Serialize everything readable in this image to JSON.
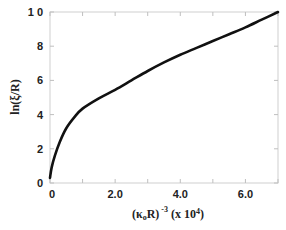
{
  "chart_data": {
    "type": "line",
    "title": "",
    "xlabel_parts": {
      "open": "(κ",
      "sub": "o",
      "mid": "R)",
      "sup": "-3",
      "scale": " (x 10",
      "scale_sup": "4",
      "close": ")"
    },
    "xlabel": "(κoR)^-3 (x 10^4)",
    "ylabel": "ln(ξ/R)",
    "xlim": [
      0,
      7.0
    ],
    "ylim": [
      0,
      10
    ],
    "xticks": [
      0,
      1,
      2,
      3,
      4,
      5,
      6,
      7
    ],
    "xtick_labels": [
      {
        "value": 0,
        "label": "0"
      },
      {
        "value": 2,
        "label": "2.0"
      },
      {
        "value": 4,
        "label": "4.0"
      },
      {
        "value": 6,
        "label": "6.0"
      }
    ],
    "yticks": [
      {
        "value": 0,
        "label": "0"
      },
      {
        "value": 2,
        "label": "2"
      },
      {
        "value": 4,
        "label": "4"
      },
      {
        "value": 6,
        "label": "6"
      },
      {
        "value": 8,
        "label": "8"
      },
      {
        "value": 10,
        "label": "1 0"
      }
    ],
    "grid": false,
    "legend": "none",
    "series": [
      {
        "name": "ln(ξ/R)",
        "x": [
          0,
          0.05,
          0.15,
          0.3,
          0.5,
          0.75,
          1.0,
          1.5,
          2.0,
          2.5,
          3.0,
          3.5,
          4.0,
          4.5,
          5.0,
          5.5,
          6.0,
          6.5,
          7.0
        ],
        "y": [
          0.3,
          0.9,
          1.6,
          2.4,
          3.2,
          3.85,
          4.35,
          4.95,
          5.45,
          6.0,
          6.55,
          7.05,
          7.5,
          7.9,
          8.3,
          8.7,
          9.1,
          9.55,
          10.0
        ]
      }
    ]
  }
}
